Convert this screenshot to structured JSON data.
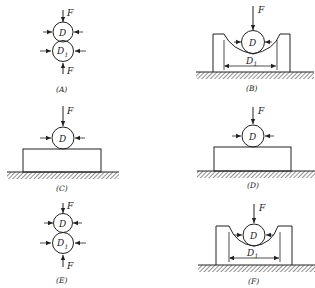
{
  "figure": {
    "panels": [
      {
        "id": "A",
        "caption": "(A)",
        "force_label": "F",
        "small_ball": "D",
        "large_ball": "D",
        "large_ball_sub": "1",
        "bottom_force_label": "F"
      },
      {
        "id": "B",
        "caption": "(B)",
        "force_label": "F",
        "ball": "D",
        "dimension": "D",
        "dimension_sub": "1"
      },
      {
        "id": "C",
        "caption": "(C)",
        "force_label": "F",
        "ball": "D"
      },
      {
        "id": "D",
        "caption": "(D)",
        "force_label": "F",
        "ball": "D"
      },
      {
        "id": "E",
        "caption": "(E)",
        "force_label": "F",
        "small_ball": "D",
        "large_ball": "D",
        "large_ball_sub": "1",
        "bottom_force_label": "F"
      },
      {
        "id": "F",
        "caption": "(F)",
        "force_label": "F",
        "ball": "D",
        "dimension": "D",
        "dimension_sub": "1"
      }
    ]
  },
  "colors": {
    "ink": "#222222",
    "background": "#ffffff"
  }
}
